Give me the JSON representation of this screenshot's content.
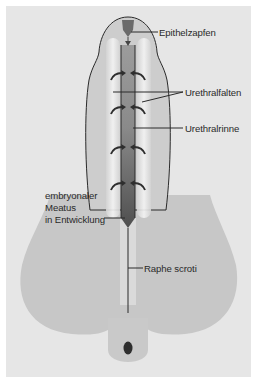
{
  "figure": {
    "type": "anatomical diagram",
    "colors": {
      "background": "#e6e6e6",
      "scrotum": "#c9c9c9",
      "shaft": "#cdcdcd",
      "fold_highlight": "#f2f2f2",
      "groove": "#8e8e8e",
      "groove_dark": "#555555",
      "epithelial_plug": "#6a6a6a",
      "outline": "#2a2a2a"
    }
  },
  "labels": {
    "epithelzapfen": "Epithelzapfen",
    "urethralfalten": "Urethralfalten",
    "urethralrinne": "Urethralrinne",
    "meatus_line1": "embryonaler",
    "meatus_line2": "Meatus",
    "meatus_line3": "in Entwicklung",
    "raphe_scroti": "Raphe scroti"
  }
}
